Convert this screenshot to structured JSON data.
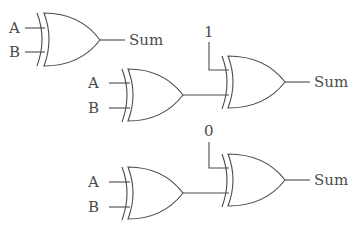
{
  "diagram": {
    "type": "logic-circuit",
    "gates": [
      {
        "id": "xor1",
        "kind": "XOR",
        "inputs": [
          "A",
          "B"
        ],
        "output": "Sum"
      },
      {
        "id": "xor2",
        "kind": "XOR",
        "inputs": [
          "A",
          "B"
        ],
        "output": "xor3.in2"
      },
      {
        "id": "xor3",
        "kind": "XOR",
        "inputs": [
          "1",
          "xor2"
        ],
        "output": "Sum"
      },
      {
        "id": "xor4",
        "kind": "XOR",
        "inputs": [
          "A",
          "B"
        ],
        "output": "xor5.in2"
      },
      {
        "id": "xor5",
        "kind": "XOR",
        "inputs": [
          "0",
          "xor4"
        ],
        "output": "Sum"
      }
    ]
  },
  "labels": {
    "c1_a": "A",
    "c1_b": "B",
    "c1_out": "Sum",
    "c2_a": "A",
    "c2_b": "B",
    "c2_const": "1",
    "c2_out": "Sum",
    "c3_a": "A",
    "c3_b": "B",
    "c3_const": "0",
    "c3_out": "Sum"
  }
}
